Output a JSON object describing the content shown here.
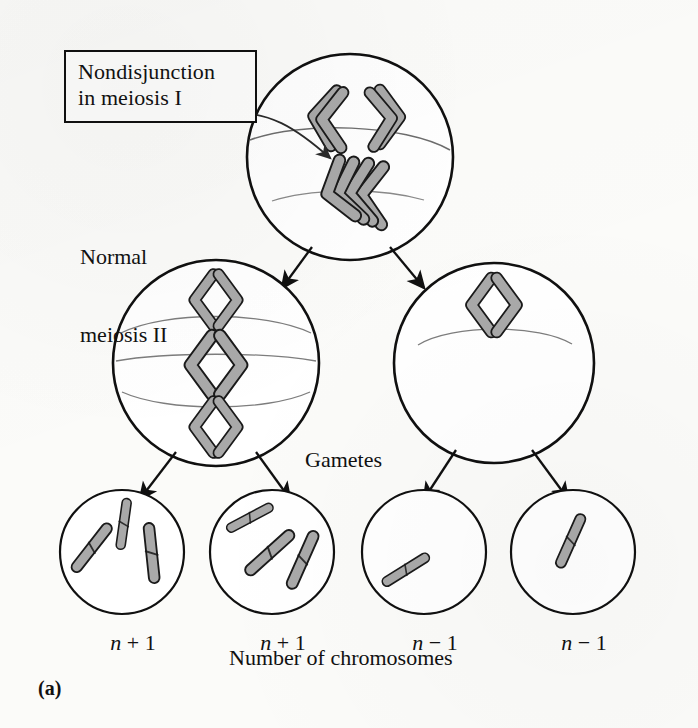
{
  "figure": {
    "panel_label": "(a)",
    "caption": "Number of chromosomes",
    "gametes_label": "Gametes",
    "nondisjunction_label": {
      "line1": "Nondisjunction",
      "line2": "in meiosis I"
    },
    "normal_meiosis_label": {
      "line1": "Normal",
      "line2": "meiosis II"
    }
  },
  "gametes": [
    {
      "label_n": "n",
      "label_op": " + 1",
      "chromosome_count": 3
    },
    {
      "label_n": "n",
      "label_op": " + 1",
      "chromosome_count": 3
    },
    {
      "label_n": "n",
      "label_op": " − 1",
      "chromosome_count": 1
    },
    {
      "label_n": "n",
      "label_op": " − 1",
      "chromosome_count": 1
    }
  ],
  "cells": {
    "parent": {
      "name": "meiosis-I-cell",
      "chromosome_pairs_top": 2,
      "nondisjunction_cluster": 4
    },
    "left_daughter": {
      "name": "daughter-cell-with-extra-chromosomes",
      "chromosome_pairs": 3
    },
    "right_daughter": {
      "name": "daughter-cell-missing-chromosomes",
      "chromosome_pairs": 1
    }
  },
  "colors": {
    "ink": "#101010",
    "chromosome_fill": "#a9a9a9",
    "chromosome_stroke": "#1a1a1a",
    "paper": "#fbfbf9",
    "spindle": "#6d6d6d"
  }
}
